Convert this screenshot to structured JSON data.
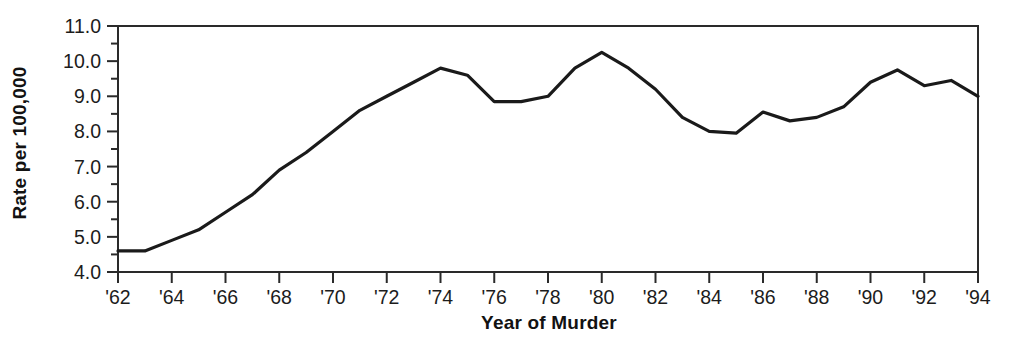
{
  "chart_data": {
    "type": "line",
    "title": "",
    "xlabel": "Year of Murder",
    "ylabel": "Rate per 100,000",
    "xlim": [
      1962,
      1994
    ],
    "ylim": [
      4.0,
      11.0
    ],
    "grid": false,
    "legend": "none",
    "y_ticks": [
      "4.0",
      "5.0",
      "6.0",
      "7.0",
      "8.0",
      "9.0",
      "10.0",
      "11.0"
    ],
    "y_tick_values": [
      4.0,
      5.0,
      6.0,
      7.0,
      8.0,
      9.0,
      10.0,
      11.0
    ],
    "y_minor_ticks": [
      4.5,
      5.5,
      6.5,
      7.5,
      8.5,
      9.5,
      10.5
    ],
    "x_ticks": [
      "'62",
      "'64",
      "'66",
      "'68",
      "'70",
      "'72",
      "'74",
      "'76",
      "'78",
      "'80",
      "'82",
      "'84",
      "'86",
      "'88",
      "'90",
      "'92",
      "'94"
    ],
    "x_tick_values": [
      1962,
      1964,
      1966,
      1968,
      1970,
      1972,
      1974,
      1976,
      1978,
      1980,
      1982,
      1984,
      1986,
      1988,
      1990,
      1992,
      1994
    ],
    "line_color": "#1a1a1a",
    "x": [
      1962,
      1963,
      1964,
      1965,
      1966,
      1967,
      1968,
      1969,
      1970,
      1971,
      1972,
      1973,
      1974,
      1975,
      1976,
      1977,
      1978,
      1979,
      1980,
      1981,
      1982,
      1983,
      1984,
      1985,
      1986,
      1987,
      1988,
      1989,
      1990,
      1991,
      1992,
      1993,
      1994
    ],
    "values": [
      4.6,
      4.6,
      4.9,
      5.2,
      5.7,
      6.2,
      6.9,
      7.4,
      8.0,
      8.6,
      9.0,
      9.4,
      9.8,
      9.6,
      8.85,
      8.85,
      9.0,
      9.8,
      10.25,
      9.8,
      9.2,
      8.4,
      8.0,
      7.95,
      8.55,
      8.3,
      8.4,
      8.7,
      9.4,
      9.75,
      9.3,
      9.45,
      9.0
    ]
  }
}
